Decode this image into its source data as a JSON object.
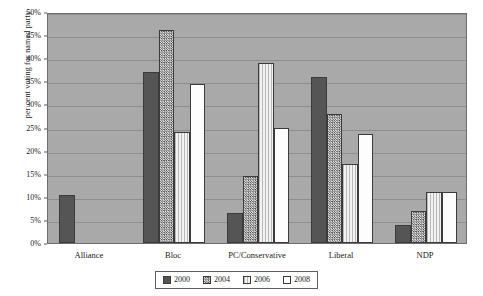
{
  "chart_data": {
    "type": "bar",
    "title": "",
    "xlabel": "",
    "ylabel": "per cent voting for named party",
    "categories": [
      "Alliance",
      "Bloc",
      "PC/Conservative",
      "Liberal",
      "NDP"
    ],
    "ylim": [
      0,
      50
    ],
    "ytick_labels": [
      "0%",
      "5%",
      "10%",
      "15%",
      "20%",
      "25%",
      "30%",
      "35%",
      "40%",
      "45%",
      "50%"
    ],
    "ytick_values": [
      0,
      5,
      10,
      15,
      20,
      25,
      30,
      35,
      40,
      45,
      50
    ],
    "grid": true,
    "legend_position": "bottom",
    "series": [
      {
        "name": "2000",
        "pattern": "solid-dark",
        "color": "#555555",
        "values": [
          10.5,
          37.0,
          6.5,
          36.0,
          4.0
        ]
      },
      {
        "name": "2004",
        "pattern": "crosshatch",
        "color": "#cfcfcf",
        "values": [
          null,
          46.0,
          14.5,
          28.0,
          7.0
        ]
      },
      {
        "name": "2006",
        "pattern": "vertical-stripe-light",
        "color": "#eeeeee",
        "values": [
          null,
          24.0,
          39.0,
          17.0,
          11.0
        ]
      },
      {
        "name": "2008",
        "pattern": "solid-white",
        "color": "#fdfdfd",
        "values": [
          null,
          34.5,
          25.0,
          23.5,
          11.0
        ]
      }
    ]
  },
  "legend": {
    "items": [
      {
        "label": "2000",
        "swatch_class": "s2000"
      },
      {
        "label": "2004",
        "swatch_class": "s2004"
      },
      {
        "label": "2006",
        "swatch_class": "s2006"
      },
      {
        "label": "2008",
        "swatch_class": "s2008"
      }
    ]
  },
  "colors": {
    "plot_background": "#a9a9a9",
    "gridline": "#8d8d8d",
    "axis": "#6e6e6e",
    "page_background": "#ffffff",
    "text": "#1a1a1a"
  }
}
